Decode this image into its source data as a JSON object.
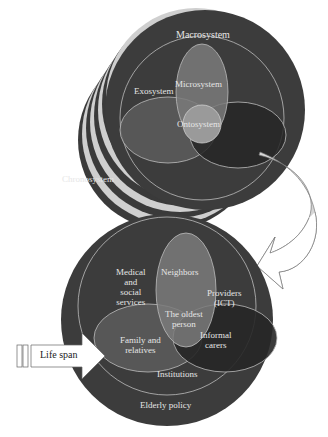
{
  "top_diagram": {
    "labels": {
      "macrosystem": "Macrosystem",
      "exosystem": "Exosystem",
      "microsystem": "Microsystem",
      "ontosystem": "Ontosystem",
      "chronosystem": "Chronosystem"
    }
  },
  "bottom_diagram": {
    "labels": {
      "medical_line1": "Medical",
      "medical_line2": "and",
      "medical_line3": "social",
      "medical_line4": "services",
      "neighbors": "Neighbors",
      "providers_line1": "Providers",
      "providers_line2": "(ICT)",
      "older_line1": "The oldest",
      "older_line2": "person",
      "family_line1": "Family and",
      "family_line2": "relatives",
      "informal_line1": "Informal",
      "informal_line2": "carers",
      "institutions": "Institutions",
      "elderly_policy": "Elderly policy"
    }
  },
  "life_span_arrow": {
    "label": "Life span"
  },
  "colors": {
    "disc_dark": "#3c3c3c",
    "disc_stripe": "#c8c8c8",
    "ring_line": "#bdbdbd",
    "micro_fill": "#7a7a7a",
    "left_ellipse_fill": "#5a5a5a",
    "right_ellipse_fill": "#262626",
    "onto_fill": "#9a9a9a",
    "connector_fill": "#d6d6d6"
  }
}
